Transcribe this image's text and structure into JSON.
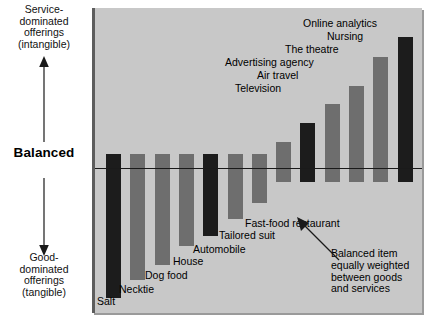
{
  "axis": {
    "top_caption": "Service-\ndominated\nofferings\n(intangible)",
    "top_caption_lines": [
      "Service-",
      "dominated",
      "offerings",
      "(intangible)"
    ],
    "bottom_caption_lines": [
      "Good-",
      "dominated",
      "offerings",
      "(tangible)"
    ],
    "center_label": "Balanced",
    "up_arrow_icon": "arrow-up-icon",
    "down_arrow_icon": "arrow-down-icon"
  },
  "annotation": {
    "lines": [
      "Balanced item",
      "equally weighted",
      "between goods",
      "and services"
    ],
    "arrow_icon": "callout-arrow-icon"
  },
  "colors": {
    "panel_background": "#c8c8c8",
    "panel_edge": "#5d5d5d",
    "bar_dark": "#1c1c1c",
    "bar_gray": "#6e6e6e",
    "zero_line": "#1a1a1a",
    "text": "#000000",
    "page_background": "#ffffff"
  },
  "chart_data": {
    "type": "bar",
    "title": "",
    "subtitle": "",
    "xlabel": "",
    "ylabel": "Balanced",
    "ylim": [
      -100,
      100
    ],
    "grid": false,
    "legend": "none",
    "orientation": "vertical-diverging",
    "zero_label": "Balanced",
    "axis_top_label": "Service-dominated offerings (intangible)",
    "axis_bottom_label": "Good-dominated offerings (tangible)",
    "categories": [
      "Salt",
      "Necktie",
      "Dog food",
      "House",
      "Automobile",
      "Tailored suit",
      "Fast-food restaurant",
      "Television",
      "Air travel",
      "Advertising agency",
      "The theatre",
      "Nursing",
      "Online analytics"
    ],
    "values": [
      -96,
      -83,
      -72,
      -58,
      -50,
      -38,
      -26,
      18,
      32,
      45,
      58,
      78,
      92
    ],
    "bar_shades": [
      "dark",
      "gray",
      "gray",
      "gray",
      "dark",
      "gray",
      "gray",
      "gray",
      "dark",
      "gray",
      "gray",
      "gray",
      "dark"
    ]
  }
}
